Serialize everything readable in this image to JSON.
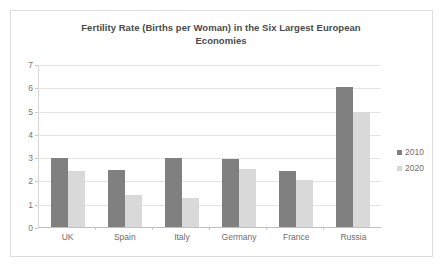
{
  "chart_data": {
    "type": "bar",
    "title": "Fertility Rate (Births per Woman) in the Six Largest European Economies",
    "title_line1": "Fertility Rate (Births per Woman) in the Six Largest European",
    "title_line2": "Economies",
    "xlabel": "",
    "ylabel": "",
    "ylim": [
      0,
      7
    ],
    "ytick_step": 1,
    "yticks": [
      "7",
      "6",
      "5",
      "4",
      "3",
      "2",
      "1",
      "0"
    ],
    "grid": true,
    "legend_position": "right",
    "categories": [
      "UK",
      "Spain",
      "Italy",
      "Germany",
      "France",
      "Russia"
    ],
    "series": [
      {
        "name": "2010",
        "color": "#808080",
        "values": [
          3.0,
          2.45,
          3.0,
          2.95,
          2.4,
          6.05
        ]
      },
      {
        "name": "2020",
        "color": "#d9d9d9",
        "values": [
          2.4,
          1.4,
          1.25,
          2.5,
          2.05,
          4.95
        ]
      }
    ]
  },
  "legend": {
    "items": [
      {
        "label": "2010",
        "color": "#808080",
        "marker": "square-marker"
      },
      {
        "label": "2020",
        "color": "#d9d9d9",
        "marker": "square-marker"
      }
    ]
  }
}
